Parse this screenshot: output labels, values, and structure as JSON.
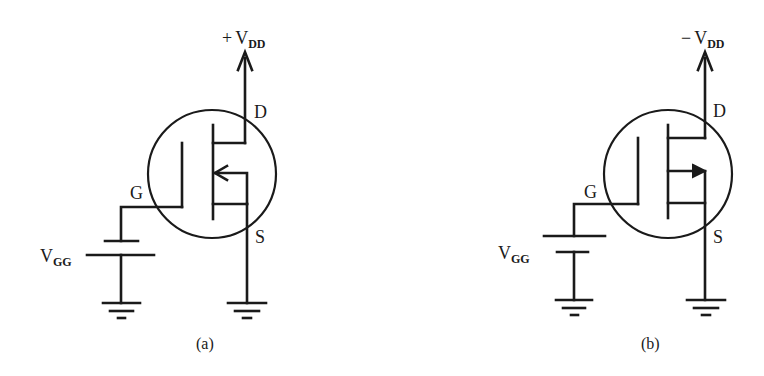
{
  "figure": {
    "panels": [
      {
        "id": "a",
        "caption": "(a)",
        "supply_sign": "+",
        "supply_label": "V",
        "supply_sub": "DD",
        "drain_label": "D",
        "gate_label": "G",
        "source_label": "S",
        "bias_label": "V",
        "bias_sub": "GG",
        "arrow_direction": "inward",
        "battery_orientation": "short-plate-top"
      },
      {
        "id": "b",
        "caption": "(b)",
        "supply_sign": "−",
        "supply_label": "V",
        "supply_sub": "DD",
        "drain_label": "D",
        "gate_label": "G",
        "source_label": "S",
        "bias_label": "V",
        "bias_sub": "GG",
        "arrow_direction": "outward",
        "battery_orientation": "long-plate-top"
      }
    ],
    "colors": {
      "ink": "#1a1a1a",
      "background": "#ffffff"
    }
  }
}
